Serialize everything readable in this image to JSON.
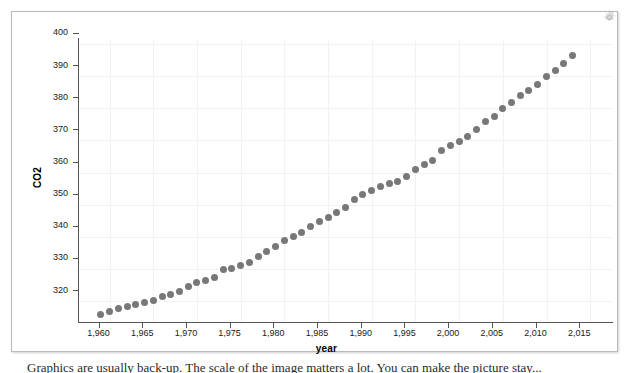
{
  "window": {
    "gear_icon": "gear-icon"
  },
  "caption": {
    "text": "Graphics are usually back-up. The scale of the image matters a lot. You can make the picture stay..."
  },
  "chart_data": {
    "type": "scatter",
    "title": "",
    "xlabel": "year",
    "ylabel": "CO2",
    "xlim": [
      1956.5,
      2017.5
    ],
    "ylim": [
      313.5,
      401.5
    ],
    "grid": true,
    "legend": null,
    "marker": {
      "shape": "circle",
      "color": "#787878",
      "size_px": 7
    },
    "x_ticks": [
      "1,960",
      "1,965",
      "1,970",
      "1,975",
      "1,980",
      "1,985",
      "1,990",
      "1,995",
      "2,000",
      "2,005",
      "2,010",
      "2,015"
    ],
    "x_tick_values": [
      1960,
      1965,
      1970,
      1975,
      1980,
      1985,
      1990,
      1995,
      2000,
      2005,
      2010,
      2015
    ],
    "y_ticks": [
      "320",
      "330",
      "340",
      "350",
      "360",
      "370",
      "380",
      "390",
      "400"
    ],
    "y_tick_values": [
      320,
      330,
      340,
      350,
      360,
      370,
      380,
      390,
      400
    ],
    "x": [
      1959,
      1960,
      1961,
      1962,
      1963,
      1964,
      1965,
      1966,
      1967,
      1968,
      1969,
      1970,
      1971,
      1972,
      1973,
      1974,
      1975,
      1976,
      1977,
      1978,
      1979,
      1980,
      1981,
      1982,
      1983,
      1984,
      1985,
      1986,
      1987,
      1988,
      1989,
      1990,
      1991,
      1992,
      1993,
      1994,
      1995,
      1996,
      1997,
      1998,
      1999,
      2000,
      2001,
      2002,
      2003,
      2004,
      2005,
      2006,
      2007,
      2008,
      2009,
      2010,
      2011,
      2012,
      2013
    ],
    "values": [
      315.97,
      316.91,
      317.64,
      318.45,
      318.99,
      319.62,
      320.04,
      321.38,
      322.16,
      323.04,
      324.62,
      325.68,
      326.32,
      327.45,
      329.68,
      330.18,
      331.11,
      332.04,
      333.83,
      335.4,
      336.84,
      338.75,
      340.11,
      341.45,
      343.05,
      344.65,
      346.12,
      347.42,
      349.19,
      351.57,
      353.12,
      354.39,
      355.61,
      356.45,
      357.1,
      358.83,
      360.82,
      362.61,
      363.73,
      366.7,
      368.38,
      369.55,
      371.14,
      373.28,
      375.8,
      377.52,
      379.8,
      381.9,
      383.79,
      385.6,
      387.43,
      389.9,
      391.65,
      393.85,
      396.52
    ]
  }
}
